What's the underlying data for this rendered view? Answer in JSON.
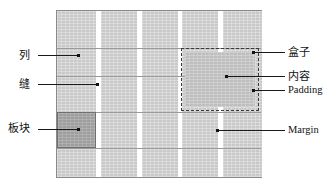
{
  "diagram": {
    "colors": {
      "column_fill": "#c9c9c9",
      "block_fill": "#9e9e9e",
      "gutter_fill": "#ffffff",
      "frame_stroke": "#8a8a8a",
      "leader_stroke": "#111111",
      "dashed_stroke": "#3a3a3a"
    },
    "grid": {
      "column_count": 5,
      "gutter_count": 4,
      "row_line_count": 4
    }
  },
  "labels": {
    "left": [
      {
        "id": "column",
        "text": "列"
      },
      {
        "id": "gutter",
        "text": "缝"
      },
      {
        "id": "block",
        "text": "板块"
      }
    ],
    "right": [
      {
        "id": "box",
        "text": "盒子"
      },
      {
        "id": "content",
        "text": "内容"
      },
      {
        "id": "padding",
        "text": "Padding"
      },
      {
        "id": "margin",
        "text": "Margin"
      }
    ]
  }
}
